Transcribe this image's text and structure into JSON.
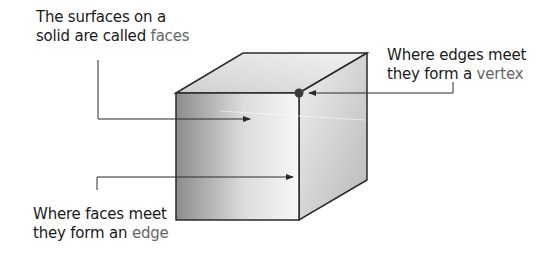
{
  "diagram": {
    "labels": {
      "faces": {
        "line1": "The surfaces on a",
        "line2_prefix": "solid are called ",
        "term": "faces"
      },
      "vertex": {
        "line1": "Where edges meet",
        "line2_prefix": "they form a ",
        "term": "vertex"
      },
      "edge": {
        "line1": "Where faces meet",
        "line2_prefix": "they form an ",
        "term": "edge"
      }
    },
    "colors": {
      "text": "#1a1a1a",
      "term": "#666666",
      "outline": "#2a2a2a",
      "vertex_dot": "#3a3a3a"
    }
  }
}
